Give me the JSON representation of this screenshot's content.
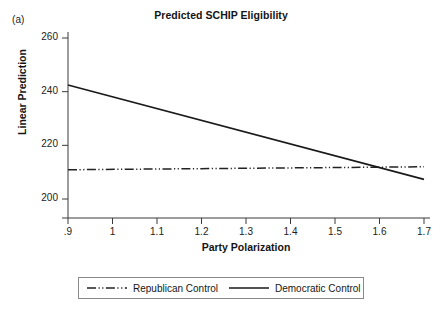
{
  "panel": {
    "label": "(a)"
  },
  "chart_data": {
    "type": "line",
    "title": "Predicted SCHIP Eligibility",
    "xlabel": "Party Polarization",
    "ylabel": "Linear Prediction",
    "xlim": [
      0.9,
      1.7
    ],
    "ylim": [
      193,
      264
    ],
    "grid": false,
    "legend_position": "bottom-outside",
    "xticks": [
      0.9,
      1.0,
      1.1,
      1.2,
      1.3,
      1.4,
      1.5,
      1.6,
      1.7
    ],
    "xtick_labels": [
      ".9",
      "1",
      "1.1",
      "1.2",
      "1.3",
      "1.4",
      "1.5",
      "1.6",
      "1.7"
    ],
    "yticks": [
      200,
      220,
      240,
      260
    ],
    "ytick_labels": [
      "200",
      "220",
      "240",
      "260"
    ],
    "x": [
      0.9,
      1.7
    ],
    "series": [
      {
        "name": "Republican Control",
        "style": "dash-dot-dot",
        "color": "#222222",
        "values": [
          210.9,
          212.0
        ]
      },
      {
        "name": "Democratic Control",
        "style": "solid",
        "color": "#1a1a1a",
        "values": [
          242.5,
          207.3
        ]
      }
    ],
    "annotations": [
      {
        "text": "lines-cross",
        "x": 1.61,
        "y": 211.8
      }
    ]
  },
  "legend": {
    "items": [
      {
        "label": "Republican Control",
        "style": "dash-dot-dot"
      },
      {
        "label": "Democratic Control",
        "style": "solid"
      }
    ]
  }
}
